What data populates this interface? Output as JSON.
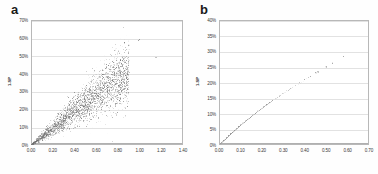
{
  "figure": {
    "background": "#ffffff",
    "point_color": "#6b6b6b",
    "grid_color": "#e2e2e2",
    "frame_color": "#b8b8b8"
  },
  "panels": [
    {
      "letter": "a",
      "ylabel": "1-SP",
      "xticks": [
        "0.00",
        "0.20",
        "0.40",
        "0.60",
        "0.80",
        "1.00",
        "1.20",
        "1.40"
      ],
      "yticks": [
        "0%",
        "10%",
        "20%",
        "30%",
        "40%",
        "50%",
        "60%",
        "70%"
      ]
    },
    {
      "letter": "b",
      "ylabel": "1-SP",
      "xticks": [
        "0.00",
        "0.10",
        "0.20",
        "0.30",
        "0.40",
        "0.50",
        "0.60",
        "0.70"
      ],
      "yticks": [
        "0%",
        "5%",
        "10%",
        "15%",
        "20%",
        "25%",
        "30%",
        "35%",
        "40%"
      ]
    }
  ],
  "chart_data": [
    {
      "type": "scatter",
      "panel": "a",
      "title": "",
      "xlabel": "",
      "ylabel": "1-SP",
      "xlim": [
        0.0,
        1.4
      ],
      "ylim": [
        0.0,
        0.7
      ],
      "xtick_values": [
        0.0,
        0.2,
        0.4,
        0.6,
        0.8,
        1.0,
        1.2,
        1.4
      ],
      "ytick_values": [
        0.0,
        0.1,
        0.2,
        0.3,
        0.4,
        0.5,
        0.6,
        0.7
      ],
      "grid": "horizontal",
      "legend": "none",
      "marker_color": "#6b6b6b",
      "description": "Dense fan-shaped cloud of several thousand points emanating from the origin along a positive near-linear trend of slope approximately 0.5, widening with increasing x; sparse outliers at high x.",
      "n_points": 4000,
      "trend_slope": 0.5,
      "spread_ratio": 0.16,
      "x_core_range": [
        0.0,
        0.9
      ],
      "outliers": [
        {
          "x": 1.0,
          "y": 0.59
        },
        {
          "x": 0.99,
          "y": 0.585
        },
        {
          "x": 1.15,
          "y": 0.49
        },
        {
          "x": 0.86,
          "y": 0.575
        },
        {
          "x": 0.9,
          "y": 0.56
        },
        {
          "x": 0.78,
          "y": 0.43
        },
        {
          "x": 0.72,
          "y": 0.35
        },
        {
          "x": 0.66,
          "y": 0.32
        }
      ]
    },
    {
      "type": "scatter",
      "panel": "b",
      "title": "",
      "xlabel": "",
      "ylabel": "1-SP",
      "xlim": [
        0.0,
        0.7
      ],
      "ylim": [
        0.0,
        0.4
      ],
      "xtick_values": [
        0.0,
        0.1,
        0.2,
        0.3,
        0.4,
        0.5,
        0.6,
        0.7
      ],
      "ytick_values": [
        0.0,
        0.05,
        0.1,
        0.15,
        0.2,
        0.25,
        0.3,
        0.35,
        0.4
      ],
      "grid": "horizontal",
      "legend": "none",
      "marker_color": "#8a8a8a",
      "description": "Sparse near-linear chain of small points from the origin to about (0.58, 37%), slightly concave with point spacing increasing at higher values.",
      "x": [
        0.005,
        0.012,
        0.02,
        0.028,
        0.036,
        0.045,
        0.054,
        0.063,
        0.072,
        0.082,
        0.092,
        0.102,
        0.112,
        0.123,
        0.134,
        0.145,
        0.157,
        0.169,
        0.181,
        0.194,
        0.207,
        0.221,
        0.235,
        0.25,
        0.265,
        0.281,
        0.298,
        0.316,
        0.335,
        0.355,
        0.377,
        0.4,
        0.425,
        0.452,
        0.462,
        0.5,
        0.53,
        0.581
      ],
      "y": [
        0.004,
        0.009,
        0.014,
        0.019,
        0.024,
        0.03,
        0.036,
        0.041,
        0.047,
        0.053,
        0.059,
        0.065,
        0.071,
        0.077,
        0.083,
        0.089,
        0.096,
        0.102,
        0.109,
        0.115,
        0.122,
        0.129,
        0.136,
        0.143,
        0.15,
        0.157,
        0.165,
        0.173,
        0.181,
        0.19,
        0.199,
        0.209,
        0.22,
        0.231,
        0.234,
        0.25,
        0.262,
        0.283
      ]
    }
  ]
}
